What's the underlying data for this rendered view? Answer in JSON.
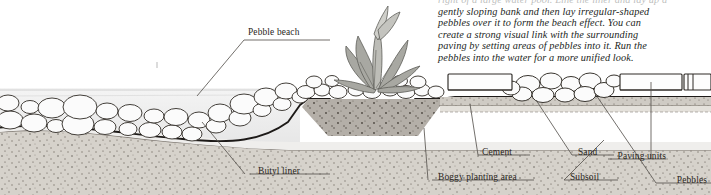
{
  "caption": {
    "lines": [
      "right of a large water pool. Line the liner and lay up a",
      "gently sloping bank and then lay irregular-shaped",
      "pebbles over it to form the beach effect. You can",
      "create a strong visual link with the surrounding",
      "paving by setting areas of pebbles into it. Run the",
      "pebbles into the water for a more unified look."
    ]
  },
  "diagram": {
    "labels": [
      {
        "id": "pebble-beach",
        "text": "Pebble beach",
        "x": 248,
        "y": 31,
        "align": "left"
      },
      {
        "id": "butyl-liner",
        "text": "Butyl liner",
        "x": 258,
        "y": 170,
        "align": "left"
      },
      {
        "id": "boggy-planting-area",
        "text": "Boggy planting area",
        "x": 438,
        "y": 176,
        "align": "left"
      },
      {
        "id": "cement",
        "text": "Cement",
        "x": 482,
        "y": 151,
        "align": "left"
      },
      {
        "id": "sand",
        "text": "Sand",
        "x": 578,
        "y": 151,
        "align": "left"
      },
      {
        "id": "subsoil",
        "text": "Subsoil",
        "x": 570,
        "y": 176,
        "align": "left"
      },
      {
        "id": "paving-units",
        "text": "Paving units",
        "x": 662,
        "y": 155,
        "align": "right"
      },
      {
        "id": "pebbles",
        "text": "Pebbles",
        "x": 705,
        "y": 179,
        "align": "right"
      }
    ],
    "colors": {
      "water": "#e9e9e9",
      "soil_top": "#b9b4ae",
      "subsoil": "#d4d0c9",
      "liner": "#1d1a18",
      "stone_fill": "#fbfbfb",
      "stone_edge": "#3b3733",
      "leader_line": "#5a5651",
      "paving_fill": "#fdfdfd",
      "plant": "#8d8d88"
    }
  }
}
